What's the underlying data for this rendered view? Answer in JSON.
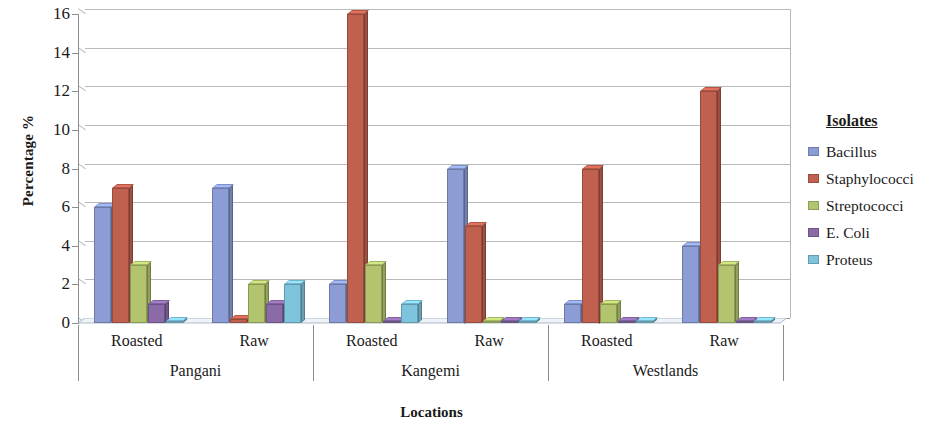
{
  "chart_data": {
    "type": "bar",
    "title": "",
    "xlabel": "Locations",
    "ylabel": "Percentage %",
    "ylim": [
      0,
      16
    ],
    "ytick_step": 2,
    "yticks": [
      16,
      14,
      12,
      10,
      8,
      6,
      4,
      2,
      0
    ],
    "grid": true,
    "legend_position": "right",
    "legend_title": "Isolates",
    "groups": [
      {
        "name": "Pangani",
        "subcategories": [
          "Roasted",
          "Raw"
        ]
      },
      {
        "name": "Kangemi",
        "subcategories": [
          "Roasted",
          "Raw"
        ]
      },
      {
        "name": "Westlands",
        "subcategories": [
          "Roasted",
          "Raw"
        ]
      }
    ],
    "categories": [
      "Pangani Roasted",
      "Pangani Raw",
      "Kangemi Roasted",
      "Kangemi Raw",
      "Westlands Roasted",
      "Westlands Raw"
    ],
    "series": [
      {
        "name": "Bacillus",
        "color": "#8b9dd4",
        "values": [
          6,
          7,
          2,
          8,
          1,
          4
        ]
      },
      {
        "name": "Staphylococci",
        "color": "#c0604f",
        "values": [
          7,
          0.2,
          16,
          5,
          8,
          12
        ]
      },
      {
        "name": "Streptococci",
        "color": "#b2c56e",
        "values": [
          3,
          2,
          3,
          0.1,
          1,
          3
        ]
      },
      {
        "name": "E. Coli",
        "color": "#8a6ba8",
        "values": [
          1,
          1,
          0.1,
          0.1,
          0.1,
          0.1
        ]
      },
      {
        "name": "Proteus",
        "color": "#7fc4dd",
        "values": [
          0.1,
          2,
          1,
          0.1,
          0.1,
          0.1
        ]
      }
    ]
  },
  "axes": {
    "y_title": "Percentage %",
    "x_title": "Locations",
    "y_tick_labels": [
      "16",
      "14",
      "12",
      "10",
      "8",
      "6",
      "4",
      "2",
      "0"
    ]
  },
  "category_labels": [
    {
      "text": "Roasted"
    },
    {
      "text": "Raw"
    },
    {
      "text": "Roasted"
    },
    {
      "text": "Raw"
    },
    {
      "text": "Roasted"
    },
    {
      "text": "Raw"
    }
  ],
  "group_labels": [
    {
      "text": "Pangani"
    },
    {
      "text": "Kangemi"
    },
    {
      "text": "Westlands"
    }
  ],
  "legend": {
    "title": "Isolates",
    "items": [
      {
        "label": "Bacillus",
        "color": "#8b9dd4",
        "swatch_icon": "legend-swatch-icon"
      },
      {
        "label": "Staphylococci",
        "color": "#c0604f",
        "swatch_icon": "legend-swatch-icon"
      },
      {
        "label": "Streptococci",
        "color": "#b2c56e",
        "swatch_icon": "legend-swatch-icon"
      },
      {
        "label": "E. Coli",
        "color": "#8a6ba8",
        "swatch_icon": "legend-swatch-icon"
      },
      {
        "label": "Proteus",
        "color": "#7fc4dd",
        "swatch_icon": "legend-swatch-icon"
      }
    ]
  },
  "colors": {
    "grid": "#b9b9b9",
    "axis": "#8d8d8d",
    "background": "#ffffff",
    "text": "#1a1a1a"
  }
}
